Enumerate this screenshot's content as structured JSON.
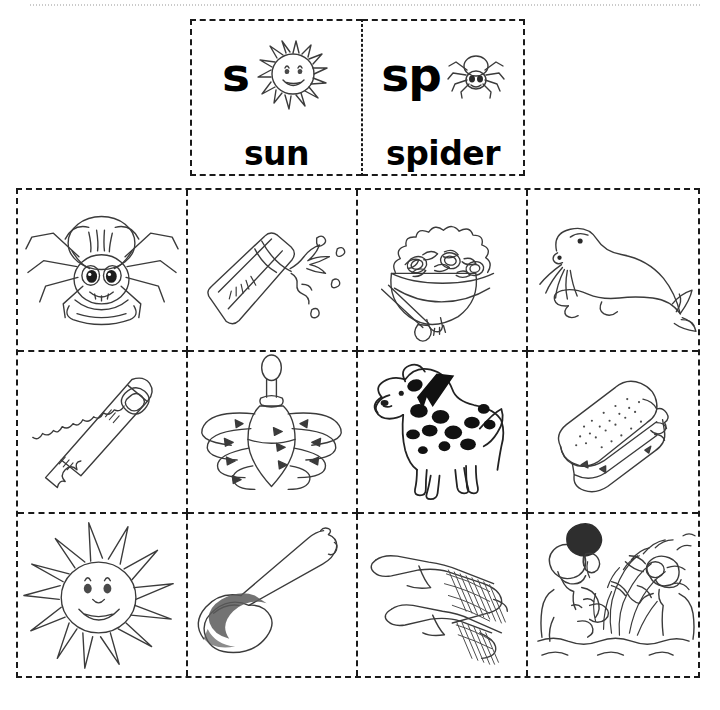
{
  "worksheet": {
    "type": "phonics-sorting-worksheet",
    "focus_sounds": [
      "s",
      "sp"
    ],
    "ink_color": "#222222",
    "paper_color": "#ffffff",
    "border_style": "dashed"
  },
  "key": {
    "columns": [
      {
        "letters": "s",
        "word": "sun",
        "icon": "sun-icon"
      },
      {
        "letters": "sp",
        "word": "spider",
        "icon": "spider-icon"
      }
    ]
  },
  "grid": {
    "columns": 4,
    "rows": 3,
    "cells": [
      {
        "position": "r1c1",
        "icon": "spider-icon",
        "word": "spider",
        "sound": "sp"
      },
      {
        "position": "r1c2",
        "icon": "spill-icon",
        "word": "spill",
        "sound": "sp"
      },
      {
        "position": "r1c3",
        "icon": "salad-icon",
        "word": "salad",
        "sound": "s"
      },
      {
        "position": "r1c4",
        "icon": "seal-icon",
        "word": "seal",
        "sound": "s"
      },
      {
        "position": "r2c1",
        "icon": "saw-icon",
        "word": "saw",
        "sound": "s"
      },
      {
        "position": "r2c2",
        "icon": "spinning-top-icon",
        "word": "spin",
        "sound": "sp"
      },
      {
        "position": "r2c3",
        "icon": "spotted-dog-icon",
        "word": "spots",
        "sound": "sp"
      },
      {
        "position": "r2c4",
        "icon": "sandwich-icon",
        "word": "sandwich",
        "sound": "s"
      },
      {
        "position": "r3c1",
        "icon": "sun-icon",
        "word": "sun",
        "sound": "s"
      },
      {
        "position": "r3c2",
        "icon": "spoon-icon",
        "word": "spoon",
        "sound": "sp"
      },
      {
        "position": "r3c3",
        "icon": "socks-icon",
        "word": "socks",
        "sound": "s"
      },
      {
        "position": "r3c4",
        "icon": "splash-icon",
        "word": "splash",
        "sound": "sp"
      }
    ]
  }
}
